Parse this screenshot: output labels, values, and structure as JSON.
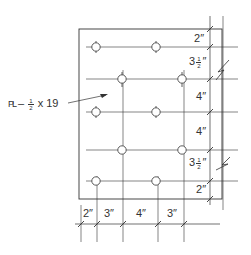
{
  "drawing": {
    "plate_label": {
      "symbol": "PL",
      "dash": "–",
      "frac_num": "1",
      "frac_den": "2",
      "rest": "x 19"
    },
    "right_dimensions": [
      {
        "whole": "2",
        "unit": "″",
        "frac_num": "",
        "frac_den": ""
      },
      {
        "whole": "3",
        "unit": "″",
        "frac_num": "1",
        "frac_den": "2"
      },
      {
        "whole": "4",
        "unit": "″",
        "frac_num": "",
        "frac_den": ""
      },
      {
        "whole": "4",
        "unit": "″",
        "frac_num": "",
        "frac_den": ""
      },
      {
        "whole": "3",
        "unit": "″",
        "frac_num": "1",
        "frac_den": "2"
      },
      {
        "whole": "2",
        "unit": "″",
        "frac_num": "",
        "frac_den": ""
      }
    ],
    "bottom_dimensions": [
      "2″",
      "3″",
      "4″",
      "3″"
    ],
    "hole_rows": 5,
    "holes_per_row": 2,
    "line_color": "#333333"
  }
}
